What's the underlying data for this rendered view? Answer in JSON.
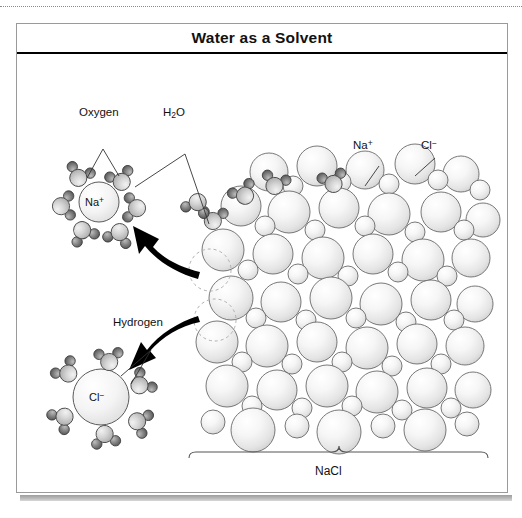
{
  "figure": {
    "title": "Water as a Solvent",
    "credit": "© Infobase Publishing"
  },
  "labels": {
    "oxygen": "Oxygen",
    "water_formula_main": "H",
    "water_formula_sub": "2",
    "water_formula_tail": "O",
    "hydrogen": "Hydrogen",
    "sodium_ion_text": "Na",
    "sodium_ion_charge": "+",
    "chloride_ion_text": "Cl",
    "chloride_ion_charge": "−",
    "lattice_sodium_text": "Na",
    "lattice_sodium_charge": "+",
    "lattice_chloride_text": "Cl",
    "lattice_chloride_charge": "−",
    "crystal_brace_label": "NaCl"
  },
  "colors": {
    "frame_border": "#9a9a9a",
    "title_rule": "#000000",
    "sphere_outline": "#6a6a6a",
    "sphere_fill_light": "#ffffff",
    "sphere_fill_shade": "#d8d8d8",
    "oxygen_fill": "#c9c9c9",
    "hydrogen_fill": "#6f6f6f",
    "ion_fill": "#ededed",
    "arrow_fill": "#000000",
    "dashed_vacancy": "#b0b0b0",
    "leader_line": "#333333"
  },
  "diagram": {
    "hydrated_sodium_waters": 6,
    "hydrated_chloride_waters": 6,
    "vacancy_circles": 2,
    "dissolution_arrows": 2,
    "lattice_large_spheres": 34,
    "lattice_small_spheres": 24
  }
}
